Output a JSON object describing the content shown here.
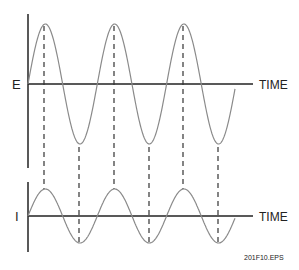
{
  "diagram": {
    "top_graph": {
      "axis_label": "E",
      "time_label": "TIME"
    },
    "bottom_graph": {
      "axis_label": "I",
      "time_label": "TIME"
    },
    "figure_id": "201F10.EPS"
  },
  "colors": {
    "axis": "#222222",
    "wave": "#8a8a8a",
    "dash": "#333333"
  }
}
